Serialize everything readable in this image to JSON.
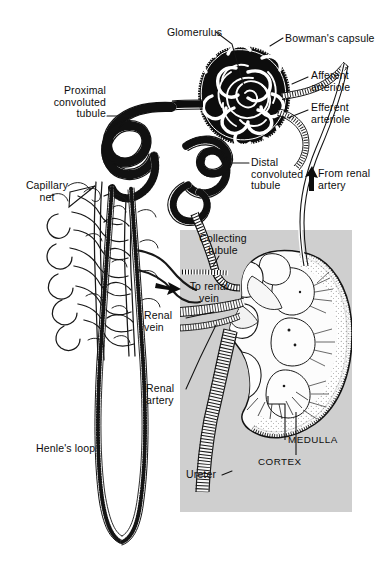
{
  "figure": {
    "background_color": "#ffffff",
    "ink_color": "#121212",
    "inset_panel_color": "#cfcfcf"
  },
  "labels": [
    {
      "id": "glomerulus",
      "text": "Glomerulus",
      "x": 167,
      "y": 27,
      "align": "left"
    },
    {
      "id": "bowmans-capsule",
      "text": "Bowman's capsule",
      "x": 285,
      "y": 33,
      "align": "left"
    },
    {
      "id": "afferent-arteriole",
      "text": "Afferent\narteriole",
      "x": 311,
      "y": 70,
      "align": "left"
    },
    {
      "id": "efferent-arteriole",
      "text": "Efferent\narteriole",
      "x": 311,
      "y": 102,
      "align": "left"
    },
    {
      "id": "proximal-convoluted-tubule",
      "text": "Proximal\nconvoluted\ntubule",
      "x": 38,
      "y": 85,
      "align": "right",
      "width": 68
    },
    {
      "id": "distal-convoluted-tubule",
      "text": "Distal\nconvoluted\ntubule",
      "x": 251,
      "y": 157,
      "align": "left"
    },
    {
      "id": "from-renal-artery",
      "text": "From renal\nartery",
      "x": 318,
      "y": 168,
      "align": "left"
    },
    {
      "id": "capillary-net",
      "text": "Capillary\nnet",
      "x": 18,
      "y": 180,
      "align": "left",
      "width": 58
    },
    {
      "id": "collecting-tubule",
      "text": "Collecting\ntubule",
      "x": 193,
      "y": 233,
      "align": "center",
      "width": 60
    },
    {
      "id": "to-renal-vein",
      "text": "To renal\nvein",
      "x": 185,
      "y": 281,
      "align": "center",
      "width": 48
    },
    {
      "id": "renal-vein",
      "text": "Renal\nvein",
      "x": 144,
      "y": 310,
      "align": "left"
    },
    {
      "id": "renal-artery",
      "text": "Renal\nartery",
      "x": 146,
      "y": 383,
      "align": "left"
    },
    {
      "id": "henles-loop",
      "text": "Henle's loop",
      "x": 36,
      "y": 443,
      "align": "left"
    },
    {
      "id": "medulla",
      "text": "MEDULLA",
      "x": 288,
      "y": 434,
      "align": "left",
      "caps": true
    },
    {
      "id": "cortex",
      "text": "CORTEX",
      "x": 258,
      "y": 456,
      "align": "left",
      "caps": true
    },
    {
      "id": "ureter",
      "text": "Ureter",
      "x": 186,
      "y": 469,
      "align": "left"
    }
  ],
  "structures": {
    "glomerulus": "dark oval tuft of coiled capillaries inside Bowman's capsule",
    "bowmans_capsule": "black cup-shaped capsule enclosing the glomerulus",
    "afferent_arteriole": "vessel entering the glomerulus from upper right",
    "efferent_arteriole": "vessel leaving the glomerulus toward lower right",
    "proximal_convoluted_tubule": "thick hatched coiled tubule at upper left",
    "distal_convoluted_tubule": "coiled tubule at middle right of nephron",
    "capillary_net": "dense peritubular capillary network",
    "collecting_tubule": "tubule running right into the kidney inset",
    "henles_loop": "long descending and ascending limb loop at bottom",
    "renal_artery": "vessel supplying the kidney",
    "renal_vein": "vessel draining the kidney",
    "ureter": "tube leaving the kidney hilum downward",
    "kidney_inset": "bean-shaped kidney cross section showing cortex, medulla, pyramids and pelvis"
  },
  "arrows": [
    {
      "id": "arrow-from-renal-artery",
      "direction": "up",
      "x": 310,
      "y": 168
    },
    {
      "id": "arrow-to-renal-vein",
      "direction": "right",
      "x": 160,
      "y": 287
    }
  ]
}
